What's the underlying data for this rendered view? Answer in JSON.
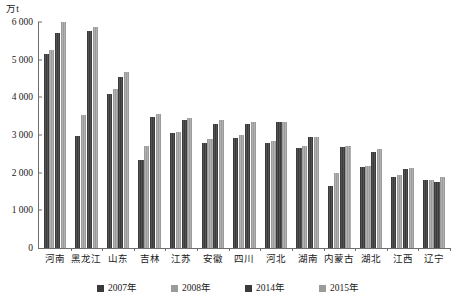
{
  "chart_data": {
    "type": "bar",
    "title": "",
    "subtitle": "",
    "xlabel": "",
    "ylabel": "万t",
    "ylim": [
      0,
      6000
    ],
    "ytick_step": 1000,
    "yticks": [
      "0",
      "1 000",
      "2 000",
      "3 000",
      "4 000",
      "5 000",
      "6 000"
    ],
    "grid": false,
    "legend_position": "bottom",
    "categories": [
      "河南",
      "黑龙江",
      "山东",
      "吉林",
      "江苏",
      "安徽",
      "四川",
      "河北",
      "湖南",
      "内蒙古",
      "湖北",
      "江西",
      "辽宁"
    ],
    "series": [
      {
        "name": "2007年",
        "color": "#3a3a3a",
        "values": [
          5150,
          2980,
          4100,
          2330,
          3050,
          2800,
          2920,
          2800,
          2650,
          1650,
          2150,
          1880,
          1800
        ]
      },
      {
        "name": "2008年",
        "color": "#9b9b9b",
        "values": [
          5250,
          3530,
          4220,
          2720,
          3080,
          2900,
          3010,
          2850,
          2720,
          1980,
          2180,
          1930,
          1810
        ]
      },
      {
        "name": "2014年",
        "color": "#3a3a3a",
        "values": [
          5700,
          5750,
          4550,
          3480,
          3400,
          3300,
          3300,
          3350,
          2950,
          2670,
          2550,
          2100,
          1760
        ]
      },
      {
        "name": "2015年",
        "color": "#9b9b9b",
        "values": [
          6000,
          5880,
          4670,
          3560,
          3450,
          3400,
          3340,
          3350,
          2950,
          2700,
          2620,
          2120,
          1880
        ]
      }
    ]
  },
  "axis": {
    "unit_label": "万t"
  }
}
